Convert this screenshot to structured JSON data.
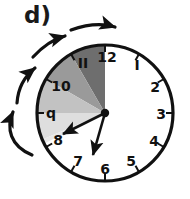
{
  "figure": {
    "panel_label": "d)",
    "type": "analog-clock-elapsed-time-diagram",
    "background_color": "#ffffff",
    "ink_color": "#111111"
  },
  "clock": {
    "center": {
      "x": 105,
      "y": 113
    },
    "radius": 68,
    "rim_color": "#111111",
    "rim_width": 3.2,
    "face_color": "#ffffff",
    "hub": {
      "radius": 4.2,
      "color": "#111111"
    },
    "hour_numerals": [
      {
        "label": "12",
        "hour": 12,
        "x": 107,
        "y": 56,
        "font_size": 14
      },
      {
        "label": "I",
        "hour": 1,
        "x": 137,
        "y": 64,
        "font_size": 14
      },
      {
        "label": "2",
        "hour": 2,
        "x": 155,
        "y": 86,
        "font_size": 14
      },
      {
        "label": "3",
        "hour": 3,
        "x": 162,
        "y": 114,
        "font_size": 14
      },
      {
        "label": "4",
        "hour": 4,
        "x": 154,
        "y": 142,
        "font_size": 14
      },
      {
        "label": "5",
        "hour": 5,
        "x": 131,
        "y": 163,
        "font_size": 14
      },
      {
        "label": "6",
        "hour": 6,
        "x": 105,
        "y": 172,
        "font_size": 14
      },
      {
        "label": "7",
        "hour": 7,
        "x": 78,
        "y": 163,
        "font_size": 14
      },
      {
        "label": "8",
        "hour": 8,
        "x": 57,
        "y": 142,
        "font_size": 14
      },
      {
        "label": "q",
        "hour": 9,
        "x": 49,
        "y": 113,
        "font_size": 14
      },
      {
        "label": "10",
        "hour": 10,
        "x": 60,
        "y": 85,
        "font_size": 14
      },
      {
        "label": "II",
        "hour": 11,
        "x": 82,
        "y": 62,
        "font_size": 14
      }
    ],
    "tick_marks": {
      "count": 12,
      "length": 7,
      "width": 2
    },
    "hands": [
      {
        "name": "hour-hand",
        "points_to_label": "8",
        "angle_deg_from_12_clockwise": 243,
        "length": 48,
        "width": 2.6,
        "has_arrowhead": true
      },
      {
        "name": "minute-hand",
        "points_to_label": "6:30",
        "angle_deg_from_12_clockwise": 195,
        "length": 42,
        "width": 2.6,
        "has_arrowhead": true
      }
    ],
    "shaded_sectors": [
      {
        "name": "sector-11-to-12",
        "from_angle_deg": 330,
        "to_angle_deg": 360,
        "fill": "#6e6e6e"
      },
      {
        "name": "sector-10-to-11",
        "from_angle_deg": 300,
        "to_angle_deg": 330,
        "fill": "#9a9a9a"
      },
      {
        "name": "sector-9-to-10",
        "from_angle_deg": 270,
        "to_angle_deg": 300,
        "fill": "#c2c2c2"
      },
      {
        "name": "sector-8h30-to-9",
        "from_angle_deg": 255,
        "to_angle_deg": 270,
        "fill": "#dedede"
      },
      {
        "name": "sector-wedge-lower-left",
        "from_angle_deg": 243,
        "to_angle_deg": 255,
        "fill": "#e8e8e8"
      }
    ]
  },
  "arrows": [
    {
      "name": "rotation-arrow-1",
      "position": "outer-lower-left",
      "direction": "clockwise"
    },
    {
      "name": "rotation-arrow-2",
      "position": "outer-left",
      "direction": "clockwise"
    },
    {
      "name": "rotation-arrow-3",
      "position": "outer-upper-left",
      "direction": "clockwise"
    },
    {
      "name": "rotation-arrow-4",
      "position": "outer-top",
      "direction": "clockwise"
    }
  ]
}
